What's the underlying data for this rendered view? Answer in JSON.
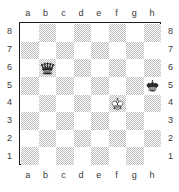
{
  "diagram": {
    "type": "chessboard",
    "orientation": "white-bottom",
    "files": [
      "a",
      "b",
      "c",
      "d",
      "e",
      "f",
      "g",
      "h"
    ],
    "ranks": [
      "8",
      "7",
      "6",
      "5",
      "4",
      "3",
      "2",
      "1"
    ],
    "colors": {
      "light_square": "#ffffff",
      "dark_square": "#bdbdbd",
      "border": "#1a1a1a",
      "label_text": "#3a3a3a",
      "white_piece_fill": "#ffffff",
      "black_piece_fill": "#2b2b2b",
      "piece_outline": "#1a1a1a"
    },
    "pieces": [
      {
        "square": "b6",
        "file": "b",
        "rank": "6",
        "color": "black",
        "type": "queen",
        "icon": "black-queen-icon"
      },
      {
        "square": "h5",
        "file": "h",
        "rank": "5",
        "color": "black",
        "type": "king",
        "icon": "black-king-icon"
      },
      {
        "square": "f4",
        "file": "f",
        "rank": "4",
        "color": "white",
        "type": "king",
        "icon": "white-king-icon"
      }
    ],
    "fen": "8/8/1q6/7k/5K2/8/8/8"
  }
}
